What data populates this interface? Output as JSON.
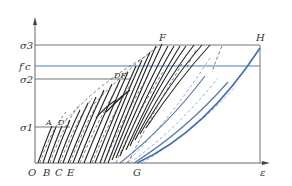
{
  "diagram": {
    "type": "stress-strain hysteresis (cyclic loading) diagram",
    "y_axis_label": "",
    "x_axis_label": "ε",
    "origin_label": "O",
    "stress_levels": [
      {
        "id": "sigma3",
        "label": "σ3",
        "y": 45
      },
      {
        "id": "fc",
        "label": "f′c",
        "y": 66
      },
      {
        "id": "sigma2",
        "label": "σ2",
        "y": 79
      },
      {
        "id": "sigma1",
        "label": "σ1",
        "y": 127
      }
    ],
    "x_axis_points": [
      {
        "label": "O",
        "x": 28
      },
      {
        "label": "B",
        "x": 43
      },
      {
        "label": "C",
        "x": 56
      },
      {
        "label": "E",
        "x": 69
      },
      {
        "label": "G",
        "x": 137
      }
    ],
    "curve_points": [
      {
        "label": "A",
        "x": 50,
        "y": 125
      },
      {
        "label": "D′",
        "x": 61,
        "y": 125
      },
      {
        "label": "DF′",
        "x": 117,
        "y": 77
      },
      {
        "label": "F",
        "x": 163,
        "y": 42
      },
      {
        "label": "H",
        "x": 260,
        "y": 42
      }
    ],
    "colors": {
      "envelope_curves": "#222222",
      "dashed_curves": "#555555",
      "final_curves": "#3f6fb0",
      "axis": "#666666"
    }
  }
}
